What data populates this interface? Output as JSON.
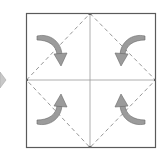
{
  "diagram": {
    "type": "origami-fold-step",
    "colors": {
      "paper_border": "#5a5a5a",
      "crease": "#9a9a9a",
      "dashed_fold": "#8a8a8a",
      "arrow_fill": "#9b9b9b",
      "arrow_stroke": "#6a6a6a",
      "step_arrow": "#c8c8c8"
    },
    "square": {
      "x": 26,
      "y": 13,
      "size": 130
    },
    "arrows": [
      {
        "corner": "top-left",
        "direction": "toward-center"
      },
      {
        "corner": "top-right",
        "direction": "toward-center"
      },
      {
        "corner": "bottom-left",
        "direction": "toward-center"
      },
      {
        "corner": "bottom-right",
        "direction": "toward-center"
      }
    ],
    "step_indicator": "previous-step-arrow"
  }
}
